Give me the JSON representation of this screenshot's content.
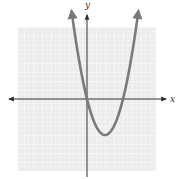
{
  "chart_data": {
    "type": "line",
    "title": "",
    "xlabel": "x",
    "ylabel": "y",
    "function": "y = x^2 - 4x",
    "xlim": [
      -8,
      8
    ],
    "ylim": [
      -8,
      8
    ],
    "grid": true,
    "legend": null,
    "series": [
      {
        "name": "parabola",
        "x": [
          -1.7,
          -1,
          0,
          1,
          2,
          3,
          4,
          5,
          5.7
        ],
        "y": [
          9.7,
          5,
          0,
          -3,
          -4,
          -3,
          0,
          5,
          9.7
        ]
      }
    ],
    "features": {
      "x_intercepts": [
        0,
        4
      ],
      "y_intercept": 0,
      "vertex": [
        2,
        -4
      ],
      "opens": "up",
      "arrows_on_curve_ends": true
    }
  },
  "labels": {
    "x_axis": "x",
    "y_axis": "y"
  },
  "colors": {
    "curve": "#7a7a7a",
    "axes": "#2f2f2f",
    "grid_bg": "#efefef",
    "grid_line": "#ffffff"
  }
}
